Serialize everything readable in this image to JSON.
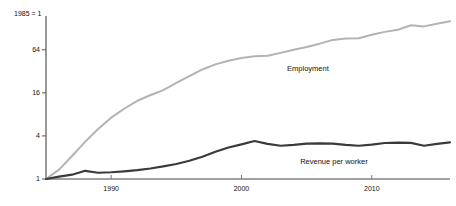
{
  "chart_data": {
    "type": "line",
    "title": "",
    "subtitle": "",
    "xlabel": "",
    "ylabel": "",
    "axis_note": "1985 = 1",
    "yscale": "log",
    "ygrid": false,
    "xgrid": false,
    "legend_position": "inline-annotation",
    "ylim": [
      1,
      190
    ],
    "xlim": [
      1985,
      2016
    ],
    "yticks": [
      1,
      4,
      16,
      64
    ],
    "ytick_labels": [
      "1",
      "4",
      "16",
      "64"
    ],
    "xticks": [
      1990,
      2000,
      2010
    ],
    "xtick_labels": [
      "1990",
      "2000",
      "2010"
    ],
    "x": [
      1985,
      1986,
      1987,
      1988,
      1989,
      1990,
      1991,
      1992,
      1993,
      1994,
      1995,
      1996,
      1997,
      1998,
      1999,
      2000,
      2001,
      2002,
      2003,
      2004,
      2005,
      2006,
      2007,
      2008,
      2009,
      2010,
      2011,
      2012,
      2013,
      2014,
      2015,
      2016
    ],
    "series": [
      {
        "name": "Employment",
        "color": "#b3b3b3",
        "label": "Employment",
        "values": [
          1.0,
          1.35,
          2.1,
          3.3,
          5.0,
          7.2,
          9.6,
          12.4,
          14.8,
          17.5,
          22.0,
          27.5,
          34.0,
          40.0,
          45.0,
          49.0,
          52.0,
          53.0,
          58.0,
          64.0,
          70.0,
          78.0,
          88.0,
          92.0,
          93.0,
          104.0,
          114.0,
          122.0,
          141.0,
          136.0,
          148.0,
          160.0
        ]
      },
      {
        "name": "Revenue per worker",
        "color": "#3a3a3a",
        "label": "Revenue per worker",
        "values": [
          1.0,
          1.08,
          1.15,
          1.3,
          1.22,
          1.24,
          1.28,
          1.33,
          1.4,
          1.5,
          1.62,
          1.8,
          2.05,
          2.4,
          2.75,
          3.05,
          3.4,
          3.1,
          2.92,
          3.0,
          3.12,
          3.15,
          3.12,
          3.0,
          2.92,
          3.02,
          3.18,
          3.22,
          3.2,
          2.92,
          3.1,
          3.25
        ]
      }
    ],
    "annotations": [
      {
        "text": "Employment",
        "x": 2003.5,
        "y": 34.0
      },
      {
        "text": "Revenue per worker",
        "x": 2004.5,
        "y": 1.72
      }
    ]
  },
  "axes": {
    "corner_label": "1985 = 1",
    "axis_color": "#555555",
    "baseline_color": "#444444"
  }
}
